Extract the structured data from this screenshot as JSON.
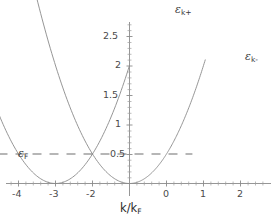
{
  "chart_data": {
    "type": "line",
    "title": "",
    "xlabel": "k/k_F",
    "ylabel": "",
    "xlim": [
      -4.5,
      2.4
    ],
    "ylim": [
      0,
      2.85
    ],
    "grid": false,
    "legend_position": "inline-curve-labels",
    "x_ticks": [
      -4,
      -3,
      -2,
      0,
      1,
      2
    ],
    "x_tick_labels": [
      "-4",
      "-3",
      "-2",
      "0",
      "1",
      "2"
    ],
    "y_ticks": [
      0.5,
      1,
      1.5,
      2,
      2.5
    ],
    "y_tick_labels": [
      "0.5",
      "1",
      "1.5",
      "2",
      "2.5"
    ],
    "series": [
      {
        "name": "epsilon_k_plus",
        "label": "ε",
        "label_sub": "k+",
        "style": "solid",
        "vertex": [
          -2,
          0
        ],
        "curvature": 0.5,
        "x_start": -4.5,
        "x_end": 0.0
      },
      {
        "name": "epsilon_k_minus",
        "label": "ε",
        "label_sub": "k-",
        "style": "solid",
        "vertex": [
          0,
          0
        ],
        "curvature": 0.5,
        "x_start": -4.5,
        "x_end": 2.05
      },
      {
        "name": "fermi_level",
        "label": "ε",
        "label_sub": "F",
        "style": "dashed",
        "value": 0.5,
        "x_start": -4.0,
        "x_end": 1.7
      }
    ]
  },
  "labels": {
    "x_axis_title_main": "k/k",
    "x_axis_title_sub": "F",
    "eps_plus": "ε",
    "eps_plus_sub": "k+",
    "eps_minus": "ε",
    "eps_minus_sub": "k-",
    "eps_fermi": "ε",
    "eps_fermi_sub": "F"
  },
  "ticks": {
    "x": [
      "-4",
      "-3",
      "-2",
      "0",
      "1",
      "2"
    ],
    "y": [
      "2.5",
      "2",
      "1.5",
      "1",
      "0.5"
    ]
  },
  "colors": {
    "background": "#ffffff",
    "curve": "#8a8a8a",
    "axis": "#8a8a8a",
    "text": "#3a3a3a"
  }
}
